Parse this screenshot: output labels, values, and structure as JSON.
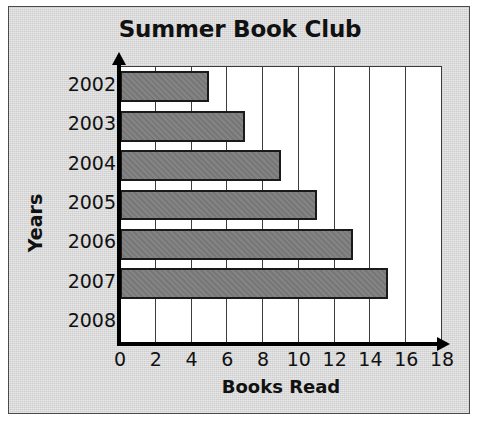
{
  "chart_data": {
    "type": "bar",
    "orientation": "horizontal",
    "title": "Summer Book Club",
    "xlabel": "Books Read",
    "ylabel": "Years",
    "categories": [
      "2002",
      "2003",
      "2004",
      "2005",
      "2006",
      "2007",
      "2008"
    ],
    "values": [
      5,
      7,
      9,
      11,
      13,
      15,
      0
    ],
    "xticks": [
      0,
      2,
      4,
      6,
      8,
      10,
      12,
      14,
      16,
      18
    ],
    "xlim": [
      0,
      18
    ],
    "grid": "vertical",
    "legend": "none",
    "colors": {
      "bar_fill": "#7d7d7d",
      "bar_stroke": "#1a1a1a",
      "plot_background": "#ffffff",
      "page_background": "#d6d6d6",
      "gridline": "#3d3d3d",
      "axis": "#000000",
      "text": "#111111"
    }
  }
}
